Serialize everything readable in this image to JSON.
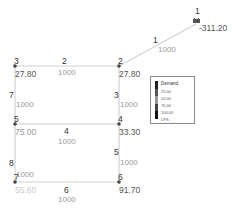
{
  "diagram": {
    "type": "pipe-network",
    "nodes": [
      {
        "id": "1",
        "kind": "reservoir",
        "value": "-311.20"
      },
      {
        "id": "2",
        "value": "27.80"
      },
      {
        "id": "3",
        "value": "27.80"
      },
      {
        "id": "4",
        "value": "33.30"
      },
      {
        "id": "5",
        "value": "75.00"
      },
      {
        "id": "6",
        "value": "91.70"
      },
      {
        "id": "7",
        "value": "55.60"
      }
    ],
    "pipes": [
      {
        "id": "1",
        "from": "1",
        "to": "2",
        "length": "1000"
      },
      {
        "id": "2",
        "from": "3",
        "to": "2",
        "length": "1000"
      },
      {
        "id": "3",
        "from": "2",
        "to": "4",
        "length": "1000"
      },
      {
        "id": "4",
        "from": "5",
        "to": "4",
        "length": "1000"
      },
      {
        "id": "5",
        "from": "4",
        "to": "6",
        "length": "1000"
      },
      {
        "id": "6",
        "from": "7",
        "to": "6",
        "length": "1000"
      },
      {
        "id": "7",
        "from": "3",
        "to": "5",
        "length": "1000"
      },
      {
        "id": "8",
        "from": "5",
        "to": "7",
        "length": "1000"
      }
    ]
  },
  "legend": {
    "title": "Demand",
    "items": [
      "25.00",
      "50.00",
      "75.00",
      "100.00"
    ],
    "unit": "LPS",
    "colors": [
      "#222222",
      "#555555",
      "#888888",
      "#444444",
      "#111111"
    ]
  },
  "colors": {
    "pipe": "#cfcfcf",
    "node": "#444444",
    "node_value_light": "#c8c8c8"
  }
}
